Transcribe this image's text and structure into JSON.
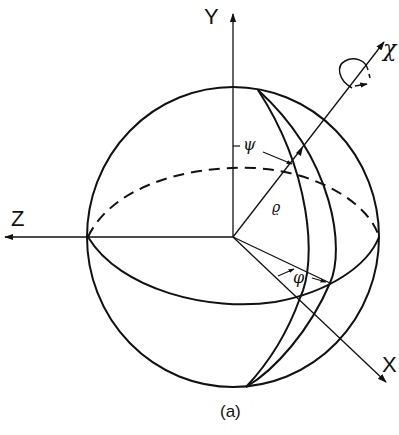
{
  "figure": {
    "caption": "(a)",
    "axes": {
      "y_label": "Y",
      "z_label": "Z",
      "x_label": "X",
      "chi_label": "χ"
    },
    "angles": {
      "psi": "ψ",
      "rho": "ϱ",
      "phi": "φ"
    },
    "colors": {
      "line": "#111111",
      "background": "#ffffff"
    }
  }
}
